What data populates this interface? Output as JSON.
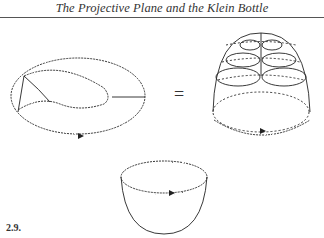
{
  "page": {
    "running_header": "The Projective Plane and the Klein Bottle",
    "figure_label": "2.9.",
    "equals_sign": "="
  },
  "figure": {
    "items": [
      {
        "name": "mobius-band-with-wavy-boundary",
        "description": "band with self-intersecting twist and wavy boundary, arrow on lower edge"
      },
      {
        "name": "dome-cross-cap",
        "description": "dome with dashed and solid latitudinal circles and central seam, wavy base with arrow"
      },
      {
        "name": "hemisphere-disc",
        "description": "hemispherical bowl with wavy rim and arrow"
      }
    ]
  }
}
